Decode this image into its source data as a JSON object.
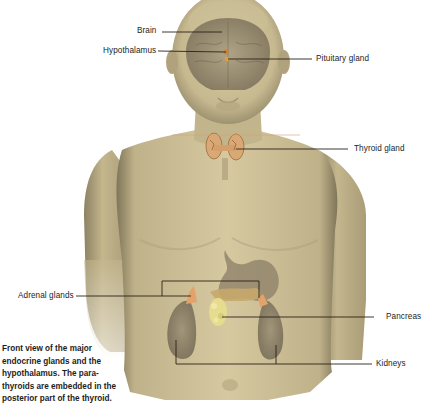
{
  "figure": {
    "title": "Front view of the major endocrine glands",
    "colors": {
      "skin": "#c9bb92",
      "skin_dark": "#8f8463",
      "organ": "#8a7d66",
      "gland_orange": "#d9a06a",
      "pancreas": "#e3d98a",
      "leader_line": "#2a2218",
      "background": "#ffffff"
    },
    "labels": {
      "brain": "Brain",
      "hypothalamus": "Hypothalamus",
      "pituitary": "Pituitary gland",
      "thyroid": "Thyroid gland",
      "adrenal": "Adrenal glands",
      "pancreas": "Pancreas",
      "kidneys": "Kidneys"
    },
    "caption": {
      "lines": [
        "Front view of the major",
        "endocrine glands and the",
        "hypothalamus. The para-",
        "thyroids are embedded in the",
        "posterior part of the thyroid."
      ]
    }
  }
}
